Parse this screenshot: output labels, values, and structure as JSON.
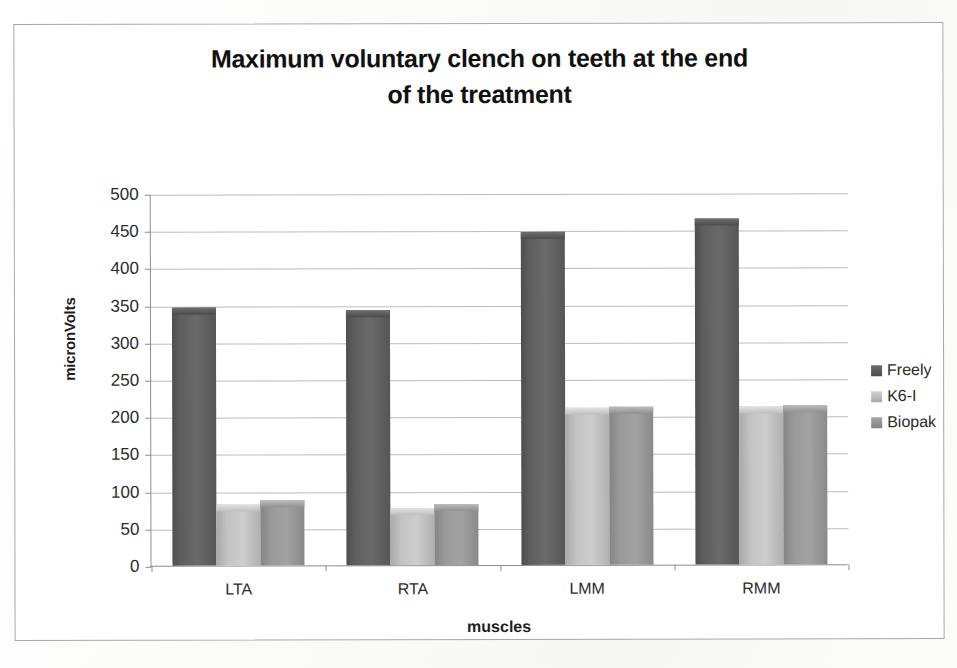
{
  "chart_data": {
    "type": "bar",
    "title": "Maximum voluntary clench on teeth at the end of the treatment",
    "title_line1": "Maximum voluntary clench on teeth at the end",
    "title_line2": "of the treatment",
    "xlabel": "muscles",
    "ylabel": "micronVolts",
    "categories": [
      "LTA",
      "RTA",
      "LMM",
      "RMM"
    ],
    "series": [
      {
        "name": "Freely",
        "values": [
          347,
          343,
          448,
          465
        ],
        "color": "#5d5d5d"
      },
      {
        "name": "K6-I",
        "values": [
          82,
          77,
          211,
          212
        ],
        "color": "#c3c3c3"
      },
      {
        "name": "Biopak",
        "values": [
          88,
          82,
          213,
          214
        ],
        "color": "#9a9a9a"
      }
    ],
    "ylim": [
      0,
      500
    ],
    "ytick_values": [
      0,
      50,
      100,
      150,
      200,
      250,
      300,
      350,
      400,
      450,
      500
    ],
    "ytick_labels": [
      "0",
      "50",
      "100",
      "150",
      "200",
      "250",
      "300",
      "350",
      "400",
      "450",
      "500"
    ],
    "grid": true,
    "legend_position": "right",
    "legend_entries": [
      "Freely",
      "K6-I",
      "Biopak"
    ]
  }
}
